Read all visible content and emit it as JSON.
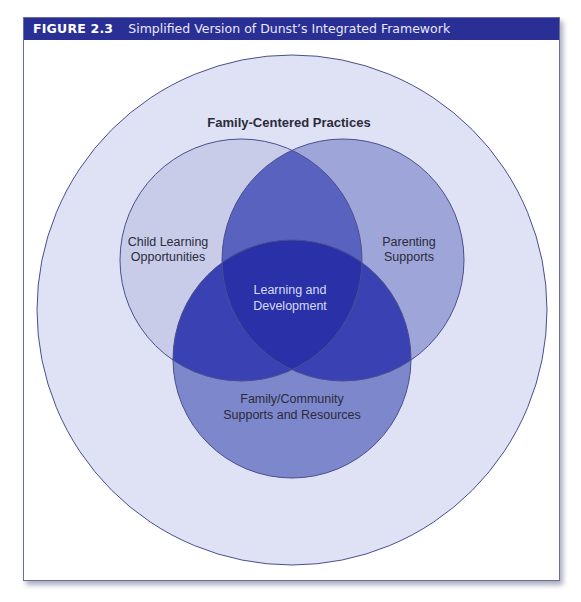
{
  "figure": {
    "number": "FIGURE 2.3",
    "title": "Simplified Version of Dunst’s Integrated Framework"
  },
  "diagram": {
    "type": "venn",
    "outer": {
      "label": "Family-Centered Practices"
    },
    "circles": [
      {
        "id": "left",
        "label_lines": [
          "Child Learning",
          "Opportunities"
        ]
      },
      {
        "id": "right",
        "label_lines": [
          "Parenting",
          "Supports"
        ]
      },
      {
        "id": "bottom",
        "label_lines": [
          "Family/Community",
          "Supports and Resources"
        ]
      }
    ],
    "center": {
      "label_lines": [
        "Learning and",
        "Development"
      ]
    }
  },
  "colors": {
    "header_bg": "#2a2f96",
    "outer_fill": "#dfe2f4",
    "left_fill": "#c8cce9",
    "right_fill": "#9ea5d8",
    "bottom_fill": "#7d87cc",
    "left_right_overlap": "#5a62c0",
    "left_bottom_overlap": "#3a41b3",
    "right_bottom_overlap": "#3a41b3",
    "center_overlap": "#2a30a8",
    "stroke": "#4a4f8e"
  }
}
